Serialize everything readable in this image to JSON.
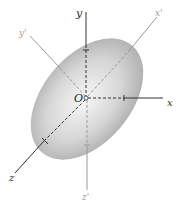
{
  "diagram": {
    "origin_label": "O",
    "axes": {
      "x": "x",
      "y": "y",
      "z": "z",
      "x_prime": "x'",
      "y_prime": "y'",
      "z_prime": "z'"
    },
    "colors": {
      "axis_dark": "#333333",
      "axis_light": "#9a9a9a",
      "ellipsoid_center": "#f4f4f4",
      "ellipsoid_edge": "#a8a8a8"
    }
  }
}
